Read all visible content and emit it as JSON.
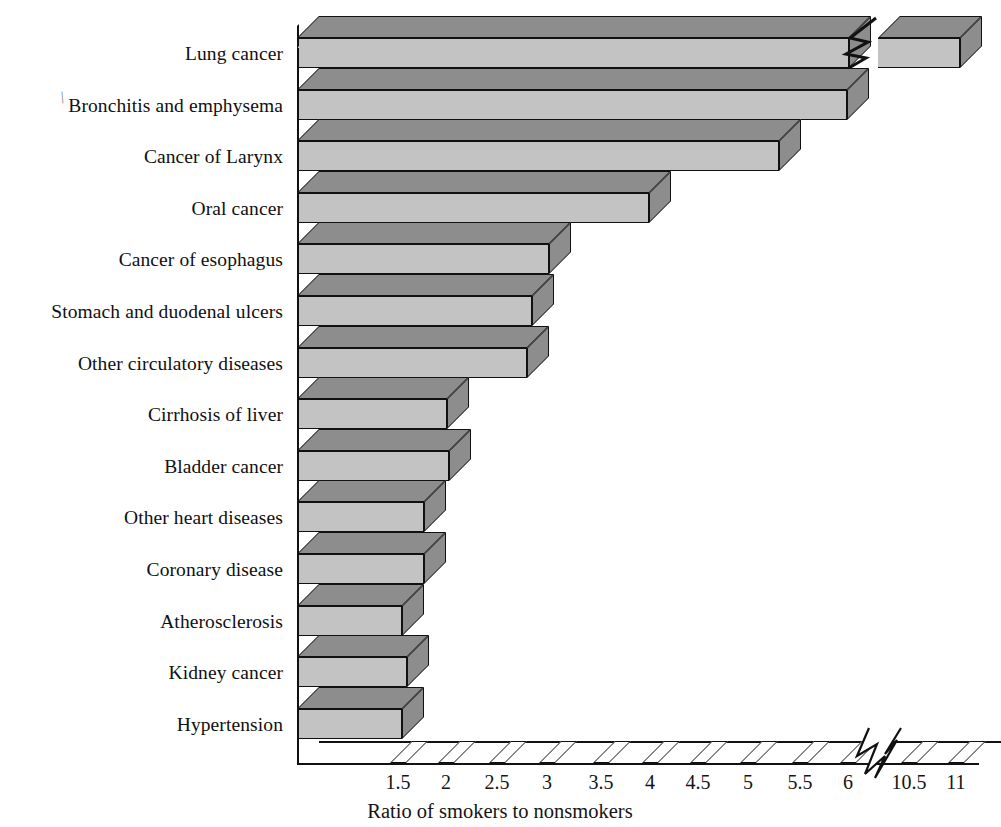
{
  "chart_data": {
    "type": "bar",
    "orientation": "horizontal",
    "title": "",
    "xlabel": "Ratio of smokers to nonsmokers",
    "ylabel": "",
    "grid": false,
    "legend": null,
    "axis_break": {
      "after": 6,
      "before": 10.5,
      "note": "x-axis is broken between 6 and 10.5"
    },
    "xlim": [
      1,
      11.3
    ],
    "xticks": [
      "1.5",
      "2",
      "2.5",
      "3",
      "3.5",
      "4",
      "4.5",
      "5",
      "5.5",
      "6",
      "10.5",
      "11"
    ],
    "xtick_values": [
      1.5,
      2,
      2.5,
      3,
      3.5,
      4,
      4.5,
      5,
      5.5,
      6,
      10.5,
      11
    ],
    "categories": [
      "Lung cancer",
      "Bronchitis and emphysema",
      "Cancer of Larynx",
      "Oral cancer",
      "Cancer of esophagus",
      "Stomach and duodenal ulcers",
      "Other circulatory diseases",
      "Cirrhosis of liver",
      "Bladder cancer",
      "Other heart diseases",
      "Coronary disease",
      "Atherosclerosis",
      "Kidney cancer",
      "Hypertension"
    ],
    "values": [
      10.8,
      6.1,
      5.4,
      4.5,
      3.5,
      3.3,
      2.6,
      2.5,
      2.0,
      1.9,
      1.7,
      1.5,
      1.4,
      1.3
    ],
    "colors": {
      "bar_front": "#c3c3c3",
      "bar_top": "#8d8d8d",
      "bar_side": "#8d8d8d",
      "outline": "#111111",
      "background": "#ffffff",
      "text": "#141414"
    }
  },
  "bars": [
    {
      "label": "Lung cancer",
      "value": 10.8,
      "front_px": 552,
      "broken": true,
      "seg2_left_px": 878,
      "seg2_width_px": 82
    },
    {
      "label": "Bronchitis and emphysema",
      "value": 6.1,
      "front_px": 550,
      "broken": false
    },
    {
      "label": "Cancer of Larynx",
      "value": 5.4,
      "front_px": 482,
      "broken": false
    },
    {
      "label": "Oral cancer",
      "value": 4.5,
      "front_px": 352,
      "broken": false
    },
    {
      "label": "Cancer of esophagus",
      "value": 3.5,
      "front_px": 252,
      "broken": false
    },
    {
      "label": "Stomach and duodenal ulcers",
      "value": 3.3,
      "front_px": 235,
      "broken": false
    },
    {
      "label": "Other circulatory diseases",
      "value": 2.6,
      "front_px": 230,
      "broken": false
    },
    {
      "label": "Cirrhosis of liver",
      "value": 2.5,
      "front_px": 150,
      "broken": false
    },
    {
      "label": "Bladder cancer",
      "value": 2.0,
      "front_px": 152,
      "broken": false
    },
    {
      "label": "Other heart diseases",
      "value": 1.9,
      "front_px": 127,
      "broken": false
    },
    {
      "label": "Coronary disease",
      "value": 1.7,
      "front_px": 127,
      "broken": false
    },
    {
      "label": "Atherosclerosis",
      "value": 1.5,
      "front_px": 105,
      "broken": false
    },
    {
      "label": "Kidney cancer",
      "value": 1.4,
      "front_px": 110,
      "broken": false
    },
    {
      "label": "Hypertension",
      "value": 1.3,
      "front_px": 105,
      "broken": false
    }
  ],
  "xticks": [
    {
      "label": "1.5",
      "x": 398
    },
    {
      "label": "2",
      "x": 446
    },
    {
      "label": "2.5",
      "x": 497
    },
    {
      "label": "3",
      "x": 547
    },
    {
      "label": "3.5",
      "x": 601
    },
    {
      "label": "4",
      "x": 650
    },
    {
      "label": "4.5",
      "x": 698
    },
    {
      "label": "5",
      "x": 748
    },
    {
      "label": "5.5",
      "x": 800
    },
    {
      "label": "6",
      "x": 848
    },
    {
      "label": "10.5",
      "x": 909
    },
    {
      "label": "11",
      "x": 956
    }
  ],
  "axis_title": "Ratio of smokers to nonsmokers",
  "stray_mark": "\\"
}
